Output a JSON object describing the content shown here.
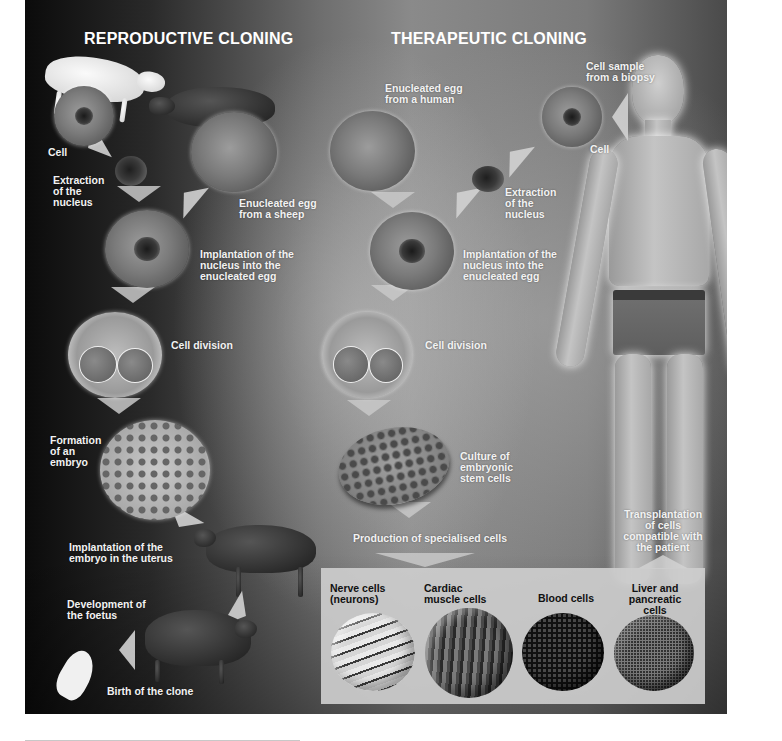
{
  "reproductive": {
    "heading": "REPRODUCTIVE CLONING",
    "labels": {
      "cell": "Cell",
      "extraction": "Extraction\nof the\nnucleus",
      "enucleated_egg": "Enucleated egg\nfrom a sheep",
      "implantation_nucleus": "Implantation of the\nnucleus into the\nenucleated egg",
      "cell_division": "Cell division",
      "embryo": "Formation\nof an\nembryo",
      "implantation_uterus": "Implantation of the\nembryo in the uterus",
      "foetus": "Development of\nthe foetus",
      "birth": "Birth of the clone"
    }
  },
  "therapeutic": {
    "heading": "THERAPEUTIC CLONING",
    "labels": {
      "enucleated_egg": "Enucleated egg\nfrom a human",
      "biopsy": "Cell sample\nfrom a biopsy",
      "cell": "Cell",
      "extraction": "Extraction\nof the\nnucleus",
      "implantation_nucleus": "Implantation of the\nnucleus into the\nenucleated egg",
      "cell_division": "Cell division",
      "culture": "Culture of\nembryonic\nstem cells",
      "production": "Production of specialised cells",
      "transplantation": "Transplantation\nof cells\ncompatible with\nthe patient"
    },
    "specialised_cells": [
      {
        "label": "Nerve cells\n(neurons)",
        "icon": "nerve-cell-sphere"
      },
      {
        "label": "Cardiac\nmuscle cells",
        "icon": "cardiac-cell-sphere"
      },
      {
        "label": "Blood cells",
        "icon": "blood-cell-sphere"
      },
      {
        "label": "Liver and\npancreatic\ncells",
        "icon": "liver-cell-sphere"
      }
    ]
  }
}
